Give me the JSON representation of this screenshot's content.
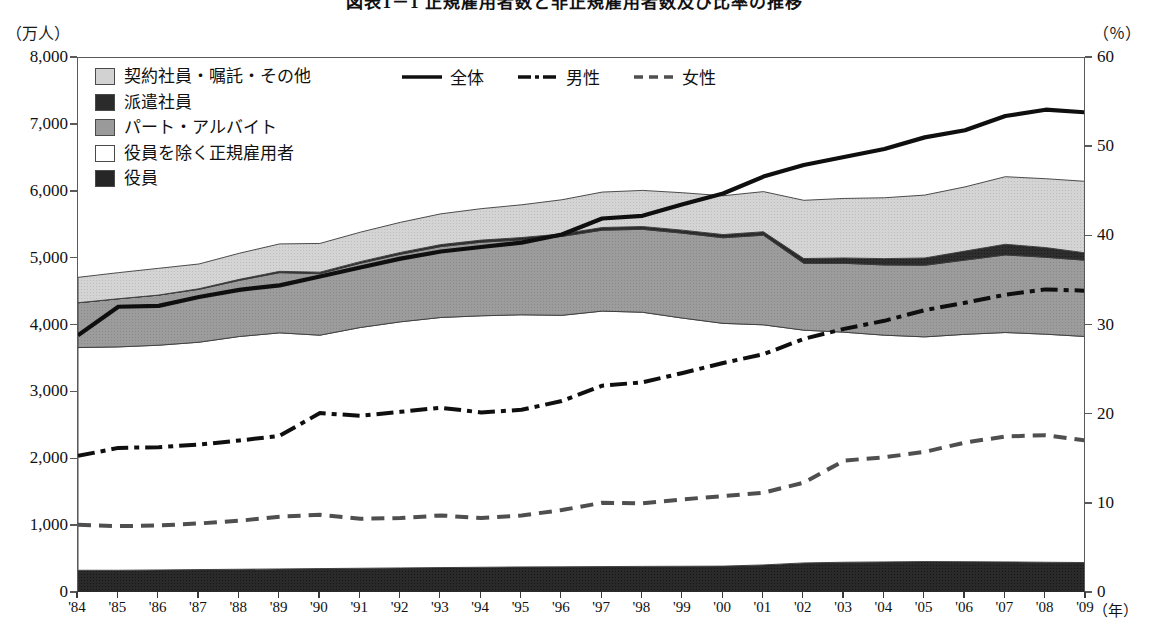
{
  "title": "図表1－1 正規雇用者数と非正規雇用者数及び比率の推移",
  "axes": {
    "left_unit": "（万人）",
    "right_unit": "（％）",
    "x_unit": "（年）",
    "left_ticks": [
      "0",
      "1,000",
      "2,000",
      "3,000",
      "4,000",
      "5,000",
      "6,000",
      "7,000",
      "8,000"
    ],
    "right_ticks": [
      "0",
      "10",
      "20",
      "30",
      "40",
      "50",
      "60"
    ],
    "x_ticks": [
      "'84",
      "'85",
      "'86",
      "'87",
      "'88",
      "'89",
      "'90",
      "'91",
      "'92",
      "'93",
      "'94",
      "'95",
      "'96",
      "'97",
      "'98",
      "'99",
      "'00",
      "'01",
      "'02",
      "'03",
      "'04",
      "'05",
      "'06",
      "'07",
      "'08",
      "'09"
    ]
  },
  "legend": {
    "areas": [
      {
        "label": "契約社員・嘱託・その他",
        "swatch": "sw-keiyaku",
        "color": "#d2d2d2"
      },
      {
        "label": "派遣社員",
        "swatch": "sw-haken",
        "color": "#2b2b2b"
      },
      {
        "label": "パート・アルバイト",
        "swatch": "sw-part",
        "color": "#9a9a9a"
      },
      {
        "label": "役員を除く正規雇用者",
        "swatch": "sw-seiki",
        "color": "#ffffff"
      },
      {
        "label": "役員",
        "swatch": "sw-yakuin",
        "color": "#262626"
      }
    ],
    "lines": [
      {
        "label": "全体",
        "style": "solid"
      },
      {
        "label": "男性",
        "style": "dash-dot"
      },
      {
        "label": "女性",
        "style": "dashed"
      }
    ]
  },
  "chart_data": {
    "type": "area",
    "title": "図表1－1 正規雇用者数と非正規雇用者数及び比率の推移",
    "xlabel": "（年）",
    "ylabel": "（万人）",
    "y2label": "（％）",
    "ylim": [
      0,
      8000
    ],
    "y2lim": [
      0,
      60
    ],
    "grid": false,
    "legend_position": "top-left",
    "x": [
      "1984",
      "1985",
      "1986",
      "1987",
      "1988",
      "1989",
      "1990",
      "1991",
      "1992",
      "1993",
      "1994",
      "1995",
      "1996",
      "1997",
      "1998",
      "1999",
      "2000",
      "2001",
      "2002",
      "2003",
      "2004",
      "2005",
      "2006",
      "2007",
      "2008",
      "2009"
    ],
    "x_tick_labels": [
      "'84",
      "'85",
      "'86",
      "'87",
      "'88",
      "'89",
      "'90",
      "'91",
      "'92",
      "'93",
      "'94",
      "'95",
      "'96",
      "'97",
      "'98",
      "'99",
      "'00",
      "'01",
      "'02",
      "'03",
      "'04",
      "'05",
      "'06",
      "'07",
      "'08",
      "'09"
    ],
    "stacked_series": [
      {
        "name": "役員",
        "axis": "left",
        "color": "#262626",
        "values": [
          340,
          340,
          345,
          350,
          355,
          360,
          365,
          370,
          375,
          380,
          385,
          390,
          392,
          395,
          398,
          400,
          402,
          420,
          450,
          460,
          465,
          470,
          468,
          465,
          460,
          455
        ]
      },
      {
        "name": "役員を除く正規雇用者",
        "axis": "left",
        "color": "#ffffff",
        "values": [
          3330,
          3340,
          3360,
          3400,
          3480,
          3530,
          3490,
          3600,
          3680,
          3740,
          3760,
          3770,
          3760,
          3820,
          3800,
          3710,
          3630,
          3590,
          3480,
          3440,
          3390,
          3360,
          3400,
          3430,
          3410,
          3380
        ]
      },
      {
        "name": "パート・アルバイト",
        "axis": "left",
        "color": "#9a9a9a",
        "values": [
          670,
          720,
          750,
          790,
          840,
          900,
          920,
          960,
          1010,
          1060,
          1100,
          1120,
          1180,
          1210,
          1240,
          1270,
          1280,
          1340,
          1000,
          1030,
          1050,
          1070,
          1110,
          1160,
          1150,
          1140
        ]
      },
      {
        "name": "派遣社員",
        "axis": "left",
        "color": "#2b2b2b",
        "values": [
          0,
          0,
          0,
          10,
          15,
          20,
          22,
          25,
          28,
          30,
          32,
          35,
          38,
          40,
          42,
          45,
          48,
          52,
          72,
          80,
          95,
          110,
          135,
          160,
          145,
          110
        ]
      },
      {
        "name": "契約社員・嘱託・その他",
        "axis": "left",
        "color": "#d2d2d2",
        "values": [
          380,
          390,
          400,
          370,
          390,
          410,
          430,
          440,
          450,
          460,
          470,
          490,
          510,
          530,
          540,
          560,
          580,
          600,
          870,
          890,
          910,
          940,
          960,
          1010,
          1030,
          1070
        ]
      }
    ],
    "line_series": [
      {
        "name": "全体",
        "axis": "right",
        "style": "solid",
        "unit": "%",
        "values": [
          28.9,
          32.1,
          32.2,
          33.2,
          34.0,
          34.5,
          35.5,
          36.5,
          37.5,
          38.3,
          38.8,
          39.3,
          40.2,
          42.0,
          42.3,
          43.6,
          44.8,
          46.7,
          48.0,
          48.9,
          49.8,
          51.1,
          51.9,
          53.5,
          54.2,
          53.9
        ]
      },
      {
        "name": "男性",
        "axis": "left",
        "style": "dash-dot",
        "unit": "万人",
        "values": [
          2050,
          2170,
          2180,
          2220,
          2280,
          2350,
          2690,
          2650,
          2710,
          2770,
          2700,
          2740,
          2870,
          3100,
          3150,
          3290,
          3440,
          3570,
          3800,
          3950,
          4070,
          4230,
          4340,
          4460,
          4540,
          4520
        ]
      },
      {
        "name": "女性",
        "axis": "left",
        "style": "dashed",
        "unit": "万人",
        "values": [
          1020,
          1000,
          1010,
          1040,
          1080,
          1140,
          1170,
          1110,
          1120,
          1160,
          1120,
          1160,
          1240,
          1350,
          1340,
          1400,
          1450,
          1500,
          1650,
          1980,
          2030,
          2110,
          2250,
          2340,
          2360,
          2280
        ]
      }
    ]
  }
}
